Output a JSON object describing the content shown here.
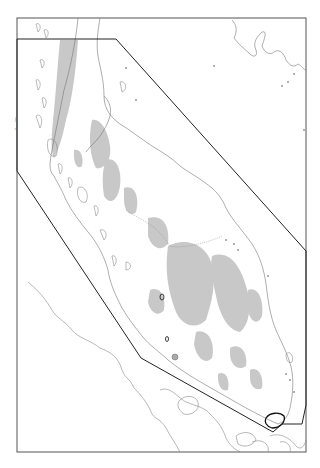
{
  "map": {
    "title": "Malay Peninsula study area",
    "colors": {
      "background": "#ffffff",
      "frame": "#555555",
      "boundary": "#222222",
      "coastline": "#777777",
      "forest_fill": "#c8c8c8",
      "highlight_outline": "#111111"
    },
    "frame": {
      "x": 17,
      "y": 18,
      "width": 289,
      "height": 434
    },
    "study_area_polygon": [
      [
        17,
        39
      ],
      [
        116,
        39
      ],
      [
        306,
        251
      ],
      [
        306,
        405
      ],
      [
        302,
        424
      ],
      [
        282,
        424
      ],
      [
        273,
        432
      ],
      [
        141,
        358
      ],
      [
        17,
        171
      ]
    ],
    "scale_text": "0 ___ km"
  }
}
